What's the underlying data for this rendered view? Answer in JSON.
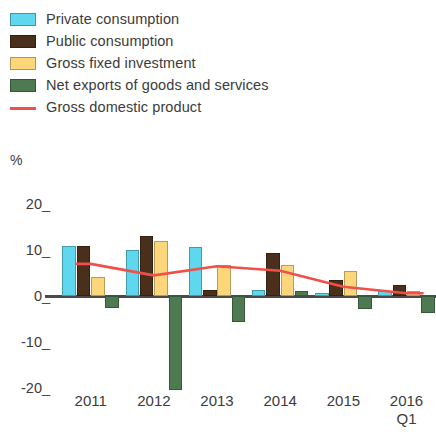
{
  "legend": {
    "items": [
      {
        "label": "Private consumption",
        "color": "#5fd7ef",
        "icon": "legend-swatch"
      },
      {
        "label": "Public consumption",
        "color": "#4a2f1c",
        "icon": "legend-swatch"
      },
      {
        "label": "Gross fixed investment",
        "color": "#fcd67a",
        "icon": "legend-swatch"
      },
      {
        "label": "Net exports of goods and services",
        "color": "#4e7a52",
        "icon": "legend-swatch"
      },
      {
        "label": "Gross domestic product",
        "color": "#f0504a",
        "icon": "legend-line"
      }
    ]
  },
  "axis": {
    "unit": "%",
    "yticks": [
      "20",
      "10",
      "0",
      "-10",
      "-20"
    ],
    "ytick_values": [
      20,
      10,
      0,
      -10,
      -20
    ],
    "xlabels": [
      {
        "main": "2011",
        "sub": ""
      },
      {
        "main": "2012",
        "sub": ""
      },
      {
        "main": "2013",
        "sub": ""
      },
      {
        "main": "2014",
        "sub": ""
      },
      {
        "main": "2015",
        "sub": ""
      },
      {
        "main": "2016",
        "sub": "Q1"
      }
    ]
  },
  "chart_data": {
    "type": "bar",
    "title": "",
    "subtitle": "",
    "xlabel": "",
    "ylabel": "%",
    "ylim": [
      -22,
      22
    ],
    "yticks": [
      20,
      10,
      0,
      -10,
      -20
    ],
    "grid": false,
    "legend_position": "top-left",
    "categories": [
      "2011",
      "2012",
      "2013",
      "2014",
      "2015",
      "2016 Q1"
    ],
    "series": [
      {
        "name": "Private consumption",
        "type": "bar",
        "color": "#5fd7ef",
        "values": [
          11.0,
          10.0,
          10.8,
          1.3,
          0.7,
          1.1
        ]
      },
      {
        "name": "Public consumption",
        "type": "bar",
        "color": "#4a2f1c",
        "values": [
          11.0,
          13.0,
          1.3,
          9.4,
          3.5,
          2.4
        ]
      },
      {
        "name": "Gross fixed investment",
        "type": "bar",
        "color": "#fcd67a",
        "values": [
          4.2,
          12.0,
          6.8,
          6.8,
          5.5,
          1.1
        ]
      },
      {
        "name": "Net exports of goods and services",
        "type": "bar",
        "color": "#4e7a52",
        "values": [
          -2.6,
          -20.5,
          -5.7,
          1.1,
          -2.9,
          -3.7
        ]
      },
      {
        "name": "Gross domestic product",
        "type": "line",
        "color": "#f0504a",
        "values": [
          7.0,
          4.5,
          6.5,
          5.5,
          2.0,
          0.6
        ]
      }
    ]
  }
}
